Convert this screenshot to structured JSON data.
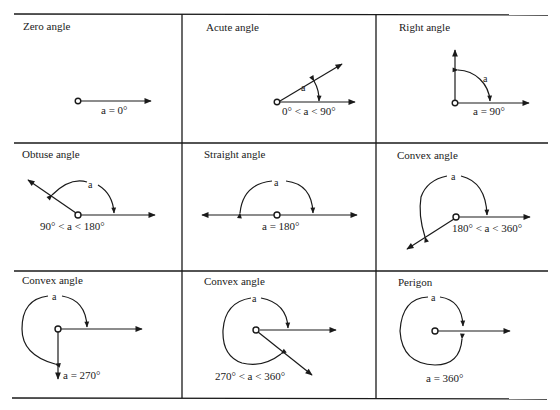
{
  "figure": {
    "cells": [
      {
        "id": "zero",
        "title": "Zero angle",
        "caption": "a = 0°",
        "arc_label": ""
      },
      {
        "id": "acute",
        "title": "Acute angle",
        "caption": "0° < a < 90°",
        "arc_label": "a"
      },
      {
        "id": "right",
        "title": "Right angle",
        "caption": "a = 90°",
        "arc_label": "a"
      },
      {
        "id": "obtuse",
        "title": "Obtuse angle",
        "caption": "90° < a < 180°",
        "arc_label": "a"
      },
      {
        "id": "straight",
        "title": "Straight angle",
        "caption": "a = 180°",
        "arc_label": "a"
      },
      {
        "id": "convex-1",
        "title": "Convex angle",
        "caption": "180° < a < 360°",
        "arc_label": "a"
      },
      {
        "id": "convex-270",
        "title": "Convex angle",
        "caption": "a = 270°",
        "arc_label": "a"
      },
      {
        "id": "convex-2",
        "title": "Convex angle",
        "caption": "270° < a < 360°",
        "arc_label": "a"
      },
      {
        "id": "perigon",
        "title": "Perigon",
        "caption": "a = 360°",
        "arc_label": "a"
      }
    ],
    "colors": {
      "line": "#1a1a1a",
      "background": "#ffffff"
    }
  }
}
